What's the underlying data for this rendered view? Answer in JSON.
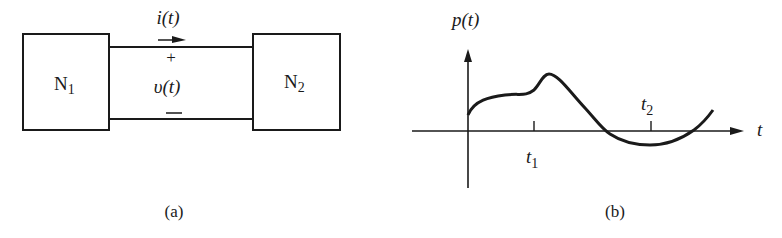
{
  "figure": {
    "panel_a": {
      "caption": "(a)",
      "left_network": {
        "label": "N",
        "subscript": "1"
      },
      "right_network": {
        "label": "N",
        "subscript": "2"
      },
      "current_label": "i(t)",
      "voltage_label": "υ(t)",
      "plus_sign": "+",
      "minus_sign": "—"
    },
    "panel_b": {
      "caption": "(b)",
      "y_axis_label": "p(t)",
      "x_axis_label": "t",
      "tick_1": {
        "label": "t",
        "subscript": "1"
      },
      "tick_2": {
        "label": "t",
        "subscript": "2"
      }
    }
  },
  "colors": {
    "ink": "#1a1a1a",
    "background": "#ffffff"
  }
}
